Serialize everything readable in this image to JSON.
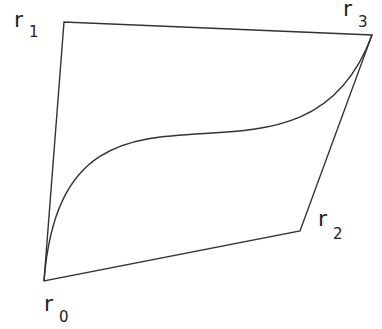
{
  "diagram": {
    "type": "cubic-bezier-control-polygon",
    "control_points": [
      {
        "id": "r0",
        "label": "r",
        "subscript": "0"
      },
      {
        "id": "r1",
        "label": "r",
        "subscript": "1"
      },
      {
        "id": "r2",
        "label": "r",
        "subscript": "2"
      },
      {
        "id": "r3",
        "label": "r",
        "subscript": "3"
      }
    ],
    "polygon_order": [
      "r0",
      "r1",
      "r3",
      "r2",
      "r0"
    ],
    "curve": {
      "from": "r0",
      "to": "r3",
      "kind": "cubic"
    },
    "stroke_color": "#333333",
    "background_color": "#ffffff"
  }
}
